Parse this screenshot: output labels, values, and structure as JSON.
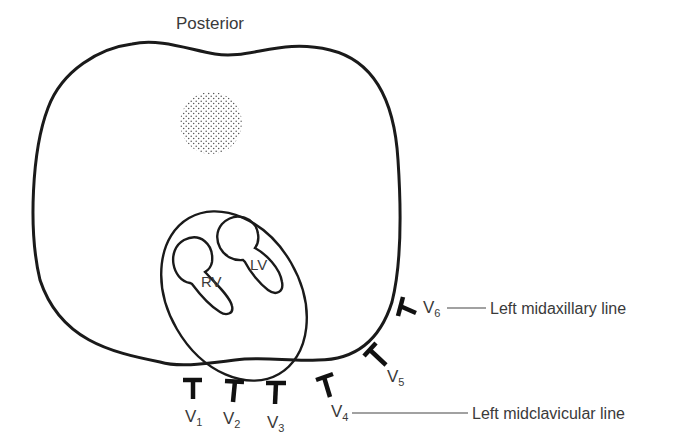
{
  "diagram": {
    "title": "Posterior",
    "structures": {
      "right_ventricle": "RV",
      "left_ventricle": "LV",
      "spine_marker": "stippled-circle"
    },
    "leads": [
      {
        "name": "V",
        "sub": "1"
      },
      {
        "name": "V",
        "sub": "2"
      },
      {
        "name": "V",
        "sub": "3"
      },
      {
        "name": "V",
        "sub": "4"
      },
      {
        "name": "V",
        "sub": "5"
      },
      {
        "name": "V",
        "sub": "6"
      }
    ],
    "landmarks": {
      "midaxillary": "Left midaxillary line",
      "midclavicular": "Left midclavicular line"
    },
    "colors": {
      "stroke": "#1a1a1a",
      "text": "#3a3a3a",
      "background": "#ffffff"
    }
  }
}
